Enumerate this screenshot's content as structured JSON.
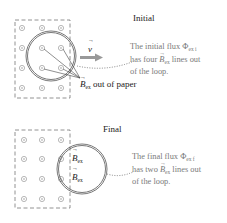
{
  "initial": {
    "title": "Initial",
    "velocity_label": "v",
    "field_label": "B",
    "field_subscript": "ex",
    "field_suffix": " out of paper",
    "note_line1": "The initial flux Φ",
    "note_line1_sub": "ex i",
    "note_line2_pre": "has four ",
    "note_line2_B": "B",
    "note_line2_sub": "ex",
    "note_line2_post": " lines out",
    "note_line3": "of the loop."
  },
  "final": {
    "title": "Final",
    "field_label_1": "B",
    "field_sub_1": "ex",
    "field_label_2": "B",
    "field_sub_2": "ex",
    "note_line1": "The final flux Φ",
    "note_line1_sub": "ex f",
    "note_line2_pre": "has two ",
    "note_line2_B": "B",
    "note_line2_sub": "ex",
    "note_line2_post": " lines out",
    "note_line3": "of the loop."
  },
  "colors": {
    "loop": "#555555",
    "arrow": "#999999",
    "note": "#7a7a7a"
  },
  "icons": {
    "field_dot": "dot-in-circle (field out of page)"
  }
}
